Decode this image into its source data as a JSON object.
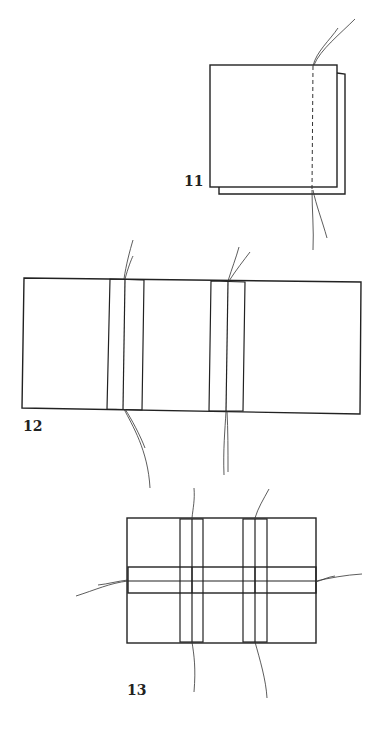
{
  "figures": [
    {
      "id": "fig-11",
      "label": "11",
      "description": "Two stacked sheets sewn along a dashed line near the right edge, thread ends emerging top and bottom"
    },
    {
      "id": "fig-12",
      "label": "12",
      "description": "Long sheet with two vertical folded strips sewn through the center, thread ends top and bottom"
    },
    {
      "id": "fig-13",
      "label": "13",
      "description": "Sheet with two vertical strips crossed by one horizontal strip, threads emerging on all four sides"
    }
  ],
  "colors": {
    "line": "#222222",
    "background": "#ffffff"
  }
}
